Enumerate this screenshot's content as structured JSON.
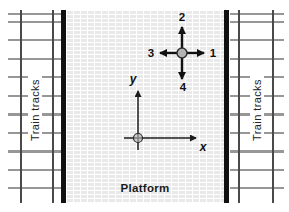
{
  "figure": {
    "left_track": {
      "label": "Train tracks"
    },
    "right_track": {
      "label": "Train tracks"
    },
    "platform": {
      "label": "Platform"
    },
    "direction_arrows": {
      "top": "2",
      "right": "1",
      "left": "3",
      "bottom": "4"
    },
    "axes": {
      "x_label": "x",
      "y_label": "y"
    },
    "colors": {
      "platform_edge": "#111111",
      "rail": "#4a4a4a",
      "tie": "#979797",
      "brick_fill": "#e9e9e9",
      "mortar": "#ffffff",
      "marker_fill": "#b3b3b3",
      "arrow": "#111111",
      "text": "#1a1a1a"
    }
  }
}
